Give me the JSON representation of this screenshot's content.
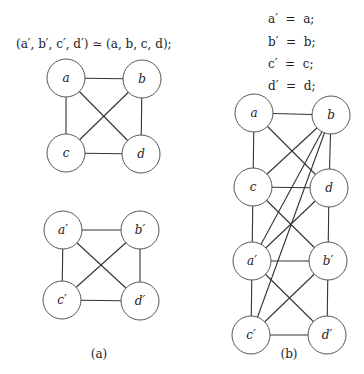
{
  "diagram_a": {
    "equation": "(a′, b′, c′, d′) ≃ (a, b, c, d);",
    "caption": "(a)",
    "graphs": [
      {
        "name": "graph-a-original",
        "nodes": [
          {
            "id": "a",
            "label": "a",
            "x": 66,
            "y": 78
          },
          {
            "id": "b",
            "label": "b",
            "x": 142,
            "y": 79
          },
          {
            "id": "c",
            "label": "c",
            "x": 66,
            "y": 153
          },
          {
            "id": "d",
            "label": "d",
            "x": 141,
            "y": 154
          }
        ],
        "edges": [
          [
            "a",
            "b"
          ],
          [
            "a",
            "c"
          ],
          [
            "a",
            "d"
          ],
          [
            "b",
            "c"
          ],
          [
            "b",
            "d"
          ],
          [
            "c",
            "d"
          ]
        ]
      },
      {
        "name": "graph-a-primed",
        "nodes": [
          {
            "id": "a'",
            "label": "a′",
            "x": 63,
            "y": 230
          },
          {
            "id": "b'",
            "label": "b′",
            "x": 140,
            "y": 230
          },
          {
            "id": "c'",
            "label": "c′",
            "x": 62,
            "y": 300
          },
          {
            "id": "d'",
            "label": "d′",
            "x": 140,
            "y": 301
          }
        ],
        "edges": [
          [
            "a'",
            "b'"
          ],
          [
            "a'",
            "c'"
          ],
          [
            "a'",
            "d'"
          ],
          [
            "b'",
            "c'"
          ],
          [
            "b'",
            "d'"
          ],
          [
            "c'",
            "d'"
          ]
        ]
      }
    ]
  },
  "diagram_b": {
    "equations": [
      "a′  =  a;",
      "b′  =  b;",
      "c′  =  c;",
      "d′  =  d;"
    ],
    "caption": "(b)",
    "graph": {
      "name": "graph-b-combined",
      "nodes": [
        {
          "id": "a",
          "label": "a",
          "x": 254,
          "y": 113
        },
        {
          "id": "b",
          "label": "b",
          "x": 331,
          "y": 115
        },
        {
          "id": "c",
          "label": "c",
          "x": 253,
          "y": 187
        },
        {
          "id": "d",
          "label": "d",
          "x": 329,
          "y": 188
        },
        {
          "id": "a'",
          "label": "a′",
          "x": 252,
          "y": 261
        },
        {
          "id": "b'",
          "label": "b′",
          "x": 328,
          "y": 261
        },
        {
          "id": "c'",
          "label": "c′",
          "x": 251,
          "y": 335
        },
        {
          "id": "d'",
          "label": "d′",
          "x": 327,
          "y": 335
        }
      ],
      "edges": [
        [
          "a",
          "b"
        ],
        [
          "a",
          "c"
        ],
        [
          "a",
          "d"
        ],
        [
          "b",
          "c"
        ],
        [
          "b",
          "d"
        ],
        [
          "c",
          "d"
        ],
        [
          "b",
          "a'"
        ],
        [
          "b",
          "c'"
        ],
        [
          "c",
          "b'"
        ],
        [
          "c",
          "a'"
        ],
        [
          "d",
          "a'"
        ],
        [
          "d",
          "b'"
        ],
        [
          "a'",
          "b'"
        ],
        [
          "a'",
          "c'"
        ],
        [
          "a'",
          "d'"
        ],
        [
          "b'",
          "c'"
        ],
        [
          "b'",
          "d'"
        ],
        [
          "c'",
          "d'"
        ]
      ]
    }
  },
  "node_radius": 19
}
